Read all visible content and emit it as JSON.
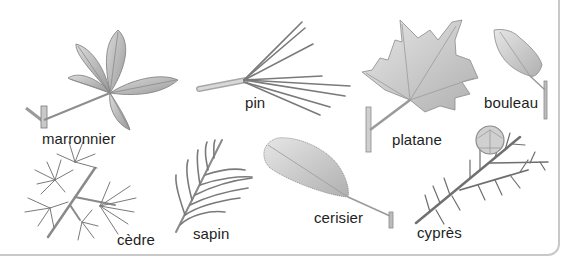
{
  "diagram": {
    "colors": {
      "leaf_fill": "#bdbdbd",
      "leaf_dark": "#8a8a8a",
      "leaf_stroke": "#6e6e6e",
      "needle": "#7a7a7a",
      "panel_border": "#c8c8c8",
      "label_text": "#1e1e1e"
    },
    "leaves": [
      {
        "id": "marronnier",
        "label": "marronnier",
        "label_pos": [
          42,
          131
        ]
      },
      {
        "id": "pin",
        "label": "pin",
        "label_pos": [
          245,
          95
        ]
      },
      {
        "id": "platane",
        "label": "platane",
        "label_pos": [
          392,
          132
        ]
      },
      {
        "id": "bouleau",
        "label": "bouleau",
        "label_pos": [
          484,
          95
        ]
      },
      {
        "id": "cedre",
        "label": "cèdre",
        "label_pos": [
          117,
          232
        ]
      },
      {
        "id": "sapin",
        "label": "sapin",
        "label_pos": [
          193,
          226
        ]
      },
      {
        "id": "cerisier",
        "label": "cerisier",
        "label_pos": [
          314,
          210
        ]
      },
      {
        "id": "cypres",
        "label": "cyprès",
        "label_pos": [
          417,
          225
        ]
      }
    ]
  }
}
